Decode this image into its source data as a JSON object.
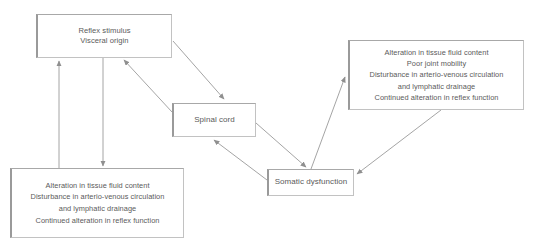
{
  "diagram": {
    "type": "flowchart",
    "nodes": [
      {
        "id": "reflex-stimulus",
        "label": "Reflex stimulus\nVisceral origin"
      },
      {
        "id": "spinal-cord",
        "label": "Spinal cord"
      },
      {
        "id": "somatic-dysfunction",
        "label": "Somatic dysfunction"
      },
      {
        "id": "effects-right",
        "label": "Alteration in tissue fluid content\nPoor joint mobility\nDisturbance in arterio-venous circulation\nand lymphatic drainage\nContinued alteration in reflex function"
      },
      {
        "id": "effects-left",
        "label": "Alteration in tissue fluid content\nDisturbance in arterio-venous circulation\nand lymphatic drainage\nContinued alteration in reflex function"
      }
    ],
    "edges": [
      {
        "id": "reflex-to-spinal",
        "from": "reflex-stimulus",
        "to": "spinal-cord"
      },
      {
        "id": "spinal-to-reflex",
        "from": "spinal-cord",
        "to": "reflex-stimulus"
      },
      {
        "id": "reflex-to-effects-left",
        "from": "reflex-stimulus",
        "to": "effects-left"
      },
      {
        "id": "effects-left-to-reflex",
        "from": "effects-left",
        "to": "reflex-stimulus"
      },
      {
        "id": "spinal-to-somatic",
        "from": "spinal-cord",
        "to": "somatic-dysfunction"
      },
      {
        "id": "somatic-to-spinal",
        "from": "somatic-dysfunction",
        "to": "spinal-cord"
      },
      {
        "id": "somatic-to-effects-right",
        "from": "somatic-dysfunction",
        "to": "effects-right"
      },
      {
        "id": "effects-right-to-somatic",
        "from": "effects-right",
        "to": "somatic-dysfunction"
      }
    ],
    "colors": {
      "line": "#9a9a9a",
      "box_border": "#b4b4b4",
      "text": "#5a5a5a",
      "background": "#ffffff"
    }
  },
  "caption": {
    "text": ""
  }
}
